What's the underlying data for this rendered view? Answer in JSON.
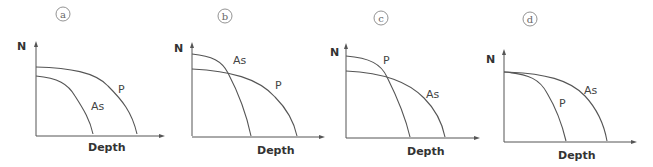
{
  "panels": [
    {
      "id": "a",
      "badge": "a",
      "y_label": "N",
      "x_label": "Depth",
      "curves": [
        {
          "name": "P",
          "label": "P",
          "description": "higher starting N, extends to greater depth"
        },
        {
          "name": "As",
          "label": "As",
          "description": "lower starting N, ends at shallower depth"
        }
      ]
    },
    {
      "id": "b",
      "badge": "b",
      "y_label": "N",
      "x_label": "Depth",
      "curves": [
        {
          "name": "As",
          "label": "As",
          "description": "higher starting N, drops steeply, ends at shallower depth"
        },
        {
          "name": "P",
          "label": "P",
          "description": "lower starting N, crosses As, extends to greater depth"
        }
      ]
    },
    {
      "id": "c",
      "badge": "c",
      "y_label": "N",
      "x_label": "Depth",
      "curves": [
        {
          "name": "P",
          "label": "P",
          "description": "higher starting N, drops steeply, ends at shallower depth"
        },
        {
          "name": "As",
          "label": "As",
          "description": "lower starting N, crosses P, extends to greater depth"
        }
      ]
    },
    {
      "id": "d",
      "badge": "d",
      "y_label": "N",
      "x_label": "Depth",
      "curves": [
        {
          "name": "As",
          "label": "As",
          "description": "same starting N, extends to greater depth"
        },
        {
          "name": "P",
          "label": "P",
          "description": "same starting N, ends at shallower depth"
        }
      ]
    }
  ]
}
